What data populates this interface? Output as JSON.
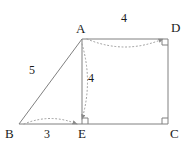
{
  "figure": {
    "type": "geometry-diagram",
    "width": 191,
    "height": 156,
    "background_color": "#ffffff",
    "line_color": "#808080",
    "arc_color": "#999999",
    "text_color": "#1a1a1a",
    "vertices": [
      {
        "name": "A",
        "label": "A",
        "x": 82,
        "y": 39,
        "label_x": 76,
        "label_y": 22
      },
      {
        "name": "B",
        "label": "B",
        "x": 19,
        "y": 124,
        "label_x": 5,
        "label_y": 127
      },
      {
        "name": "C",
        "label": "C",
        "x": 168,
        "y": 124,
        "label_x": 170,
        "label_y": 127
      },
      {
        "name": "D",
        "label": "D",
        "x": 168,
        "y": 39,
        "label_x": 171,
        "label_y": 21
      },
      {
        "name": "E",
        "label": "E",
        "x": 82,
        "y": 124,
        "label_x": 78,
        "label_y": 127
      }
    ],
    "segments": [
      {
        "name": "segment-ad",
        "from": "A",
        "to": "D"
      },
      {
        "name": "segment-ae",
        "from": "A",
        "to": "E"
      },
      {
        "name": "segment-ab",
        "from": "A",
        "to": "B"
      },
      {
        "name": "segment-be",
        "from": "B",
        "to": "E"
      },
      {
        "name": "segment-ec",
        "from": "E",
        "to": "C"
      },
      {
        "name": "segment-cd",
        "from": "C",
        "to": "D"
      }
    ],
    "right_angles": [
      {
        "name": "right-angle-e",
        "x": 82,
        "y": 124,
        "dx": 1,
        "dy": -1
      },
      {
        "name": "right-angle-c",
        "x": 168,
        "y": 124,
        "dx": -1,
        "dy": -1
      },
      {
        "name": "right-angle-d",
        "x": 168,
        "y": 39,
        "dx": -1,
        "dy": 1
      }
    ],
    "measurements": [
      {
        "name": "measure-ab",
        "value": "5",
        "from": "B",
        "to": "A",
        "label_x": 29,
        "label_y": 64
      },
      {
        "name": "measure-ad",
        "value": "4",
        "from": "A",
        "to": "D",
        "label_x": 121,
        "label_y": 12
      },
      {
        "name": "measure-ae",
        "value": "4",
        "from": "A",
        "to": "E",
        "label_x": 88,
        "label_y": 72
      },
      {
        "name": "measure-be",
        "value": "3",
        "from": "B",
        "to": "E",
        "label_x": 44,
        "label_y": 128
      }
    ]
  }
}
